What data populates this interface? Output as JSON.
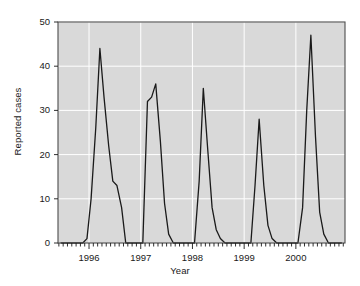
{
  "chart_data": {
    "type": "line",
    "title": "",
    "subtitle": "",
    "xlabel": "Year",
    "ylabel": "Reported cases",
    "xlim": [
      1995.4,
      2000.95
    ],
    "ylim": [
      0,
      50
    ],
    "xticks": [
      1996,
      1997,
      1998,
      1999,
      2000
    ],
    "xtick_labels": [
      "1996",
      "1997",
      "1998",
      "1999",
      "2000"
    ],
    "yticks": [
      0,
      10,
      20,
      30,
      40,
      50
    ],
    "ytick_labels": [
      "0",
      "10",
      "20",
      "30",
      "40",
      "50"
    ],
    "grid": true,
    "grid_color": "#ffffff",
    "panel_background": "#d9d9d9",
    "line_color": "#1a1a1a",
    "line_width": 1.3,
    "legend": null,
    "legend_position": "none",
    "minor_ticks": "monthly",
    "series": [
      {
        "name": "Reported cases",
        "x": [
          1995.46,
          1995.54,
          1995.63,
          1995.71,
          1995.79,
          1995.88,
          1995.96,
          1996.04,
          1996.13,
          1996.21,
          1996.29,
          1996.38,
          1996.46,
          1996.54,
          1996.63,
          1996.71,
          1996.79,
          1996.88,
          1996.96,
          1997.04,
          1997.13,
          1997.21,
          1997.29,
          1997.38,
          1997.46,
          1997.54,
          1997.63,
          1997.71,
          1997.79,
          1997.88,
          1997.96,
          1998.04,
          1998.13,
          1998.21,
          1998.29,
          1998.38,
          1998.46,
          1998.54,
          1998.63,
          1998.71,
          1998.79,
          1998.88,
          1998.96,
          1999.04,
          1999.13,
          1999.21,
          1999.29,
          1999.38,
          1999.46,
          1999.54,
          1999.63,
          1999.71,
          1999.79,
          1999.88,
          1999.96,
          2000.04,
          2000.13,
          2000.21,
          2000.29,
          2000.38,
          2000.46,
          2000.54,
          2000.63,
          2000.71,
          2000.79,
          2000.88
        ],
        "y": [
          0,
          0,
          0,
          0,
          0,
          0,
          1,
          10,
          26,
          44,
          33,
          22,
          14,
          13,
          8,
          0,
          0,
          0,
          0,
          0,
          32,
          33,
          36,
          23,
          9,
          2,
          0,
          0,
          0,
          0,
          0,
          0,
          14,
          35,
          22,
          8,
          3,
          1,
          0,
          0,
          0,
          0,
          0,
          0,
          0,
          13,
          28,
          13,
          4,
          1,
          0,
          0,
          0,
          0,
          0,
          0,
          8,
          30,
          47,
          24,
          7,
          2,
          0,
          0,
          0,
          0
        ]
      }
    ],
    "peaks": [
      {
        "year": 1996,
        "value": 44
      },
      {
        "year": 1997,
        "value": 36
      },
      {
        "year": 1998,
        "value": 35
      },
      {
        "year": 1999,
        "value": 28
      },
      {
        "year": 2000,
        "value": 47
      }
    ]
  }
}
